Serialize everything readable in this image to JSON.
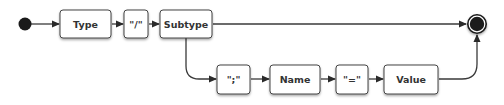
{
  "diagram": {
    "type": "railroad",
    "start_node": "start",
    "end_node": "end",
    "nodes": [
      {
        "id": "type",
        "label": "Type"
      },
      {
        "id": "slash",
        "label": "\"/\""
      },
      {
        "id": "subtype",
        "label": "Subtype"
      },
      {
        "id": "semicolon",
        "label": "\";\""
      },
      {
        "id": "name",
        "label": "Name"
      },
      {
        "id": "equals",
        "label": "\"=\""
      },
      {
        "id": "value",
        "label": "Value"
      }
    ],
    "edges": [
      {
        "from": "start",
        "to": "type"
      },
      {
        "from": "type",
        "to": "slash"
      },
      {
        "from": "slash",
        "to": "subtype"
      },
      {
        "from": "subtype",
        "to": "end"
      },
      {
        "from": "subtype",
        "to": "semicolon"
      },
      {
        "from": "semicolon",
        "to": "name"
      },
      {
        "from": "name",
        "to": "equals"
      },
      {
        "from": "equals",
        "to": "value"
      },
      {
        "from": "value",
        "to": "end"
      }
    ],
    "colors": {
      "stroke": "#3a3a3a",
      "node_fill": "#ffffff",
      "terminal": "#1a1a1a"
    }
  }
}
